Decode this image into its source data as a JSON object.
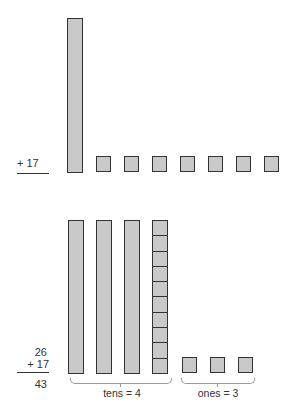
{
  "top_problem": {
    "addend": "+ 17",
    "tens_rods": 1,
    "ones_units": 7
  },
  "bottom_problem": {
    "addend1": "26",
    "addend2": "+ 17",
    "sum": "43",
    "tens_rods_solid": 3,
    "tens_rods_segmented": 1,
    "ones_units": 3,
    "tens_label": "tens = 4",
    "ones_label": "ones = 3"
  },
  "colors": {
    "block_fill": "#c9c9c9",
    "block_border": "#333333",
    "brace": "#999999"
  }
}
